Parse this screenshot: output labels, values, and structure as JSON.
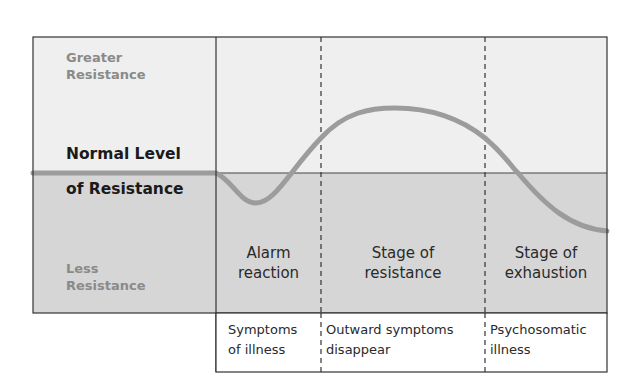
{
  "colors": {
    "upper_region": "#efefef",
    "lower_region": "#d6d6d6",
    "curve": "#9c9c9c",
    "border": "#333333",
    "secondary_label": "#8a8a8a",
    "primary_label": "#1a1a1a"
  },
  "y_axis_labels": {
    "top": [
      "Greater",
      "Resistance"
    ],
    "middle": [
      "Normal Level",
      "of Resistance"
    ],
    "bottom": [
      "Less",
      "Resistance"
    ]
  },
  "stages": [
    {
      "name": [
        "Alarm",
        "reaction"
      ],
      "outcome": [
        "Symptoms",
        "of illness"
      ]
    },
    {
      "name": [
        "Stage of",
        "resistance"
      ],
      "outcome": [
        "Outward symptoms",
        "disappear"
      ]
    },
    {
      "name": [
        "Stage of",
        "exhaustion"
      ],
      "outcome": [
        "Psychosomatic",
        "illness"
      ]
    }
  ]
}
